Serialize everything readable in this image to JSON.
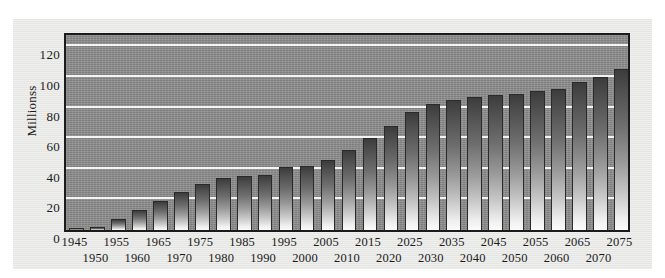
{
  "chart_data": {
    "type": "bar",
    "title": "",
    "subtitle": "",
    "xlabel": "",
    "ylabel": "Millionss",
    "ylim": [
      0,
      130
    ],
    "yticks": [
      0,
      20,
      40,
      60,
      80,
      100,
      120
    ],
    "grid": "horizontal",
    "legend": "none",
    "categories": [
      "1945",
      "1950",
      "1955",
      "1960",
      "1965",
      "1970",
      "1975",
      "1980",
      "1985",
      "1990",
      "1995",
      "2000",
      "2005",
      "2010",
      "2015",
      "2020",
      "2025",
      "2030",
      "2035",
      "2040",
      "2045",
      "2050",
      "2055",
      "2060",
      "2065",
      "2070",
      "2075"
    ],
    "values": [
      1,
      2,
      7,
      13,
      19,
      25,
      30,
      34,
      35,
      36,
      41,
      42,
      46,
      52,
      60,
      68,
      77,
      82,
      85,
      87,
      88,
      89,
      91,
      92,
      97,
      100,
      105
    ],
    "series": [
      {
        "name": "Millionss",
        "values": [
          1,
          2,
          7,
          13,
          19,
          25,
          30,
          34,
          35,
          36,
          41,
          42,
          46,
          52,
          60,
          68,
          77,
          82,
          85,
          87,
          88,
          89,
          91,
          92,
          97,
          100,
          105
        ]
      }
    ],
    "colors": {
      "plot_background": "#8a8a8a",
      "figure_background": "#e9e9e7",
      "page_background": "#ffffff",
      "gridline": "#fafafa",
      "axis_frame": "#1b1b1b",
      "bar_top": "#3c3c3c",
      "bar_bottom": "#fbfbfb",
      "bar_outline": "#2a2a2a",
      "text": "#1a1a1a"
    },
    "xtick_layout": "staggered-two-rows"
  }
}
